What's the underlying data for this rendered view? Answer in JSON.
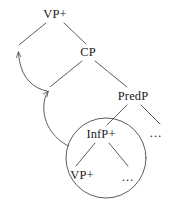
{
  "figure": {
    "type": "syntax-tree-diagram",
    "stroke_color": "#4a4a4a",
    "text_color": "#1c1c1c",
    "background_color": "#ffffff"
  },
  "nodes": [
    {
      "id": "vp-top",
      "label": "VP+",
      "x": 55,
      "y": 14
    },
    {
      "id": "cp",
      "label": "CP",
      "x": 88,
      "y": 52
    },
    {
      "id": "predp",
      "label": "PredP",
      "x": 133,
      "y": 96
    },
    {
      "id": "infp",
      "label": "InfP+",
      "x": 101,
      "y": 134
    },
    {
      "id": "vp-inner",
      "label": "VP+",
      "x": 82,
      "y": 175
    }
  ],
  "ellipses": [
    {
      "id": "predp-right-ellipsis",
      "label": "…",
      "x": 156,
      "y": 133
    },
    {
      "id": "infp-right-ellipsis",
      "label": "…",
      "x": 128,
      "y": 177
    }
  ],
  "circle": {
    "id": "circled-constituent",
    "center_x": 106,
    "center_y": 158,
    "radius": 40
  },
  "branches": [
    {
      "id": "vp-top-left-branch",
      "from": "vp-top",
      "to": "arrowhead-left"
    },
    {
      "id": "vp-top-right-branch",
      "from": "vp-top",
      "to": "cp"
    },
    {
      "id": "cp-left-branch",
      "from": "cp",
      "to": "arrowhead-mid"
    },
    {
      "id": "cp-right-branch",
      "from": "cp",
      "to": "predp"
    },
    {
      "id": "predp-left-branch",
      "from": "predp",
      "to": "infp"
    },
    {
      "id": "predp-right-branch",
      "from": "predp",
      "to": "predp-right-ellipsis"
    },
    {
      "id": "infp-left-branch",
      "from": "infp",
      "to": "vp-inner"
    },
    {
      "id": "infp-right-branch",
      "from": "infp",
      "to": "infp-right-ellipsis"
    }
  ],
  "movement_arrows": [
    {
      "id": "movement-arrow-lower",
      "from": "circled-constituent",
      "to": "cp-left-branch-foot"
    },
    {
      "id": "movement-arrow-upper",
      "from": "cp-left-branch-foot",
      "to": "vp-top-left-branch-foot"
    }
  ]
}
